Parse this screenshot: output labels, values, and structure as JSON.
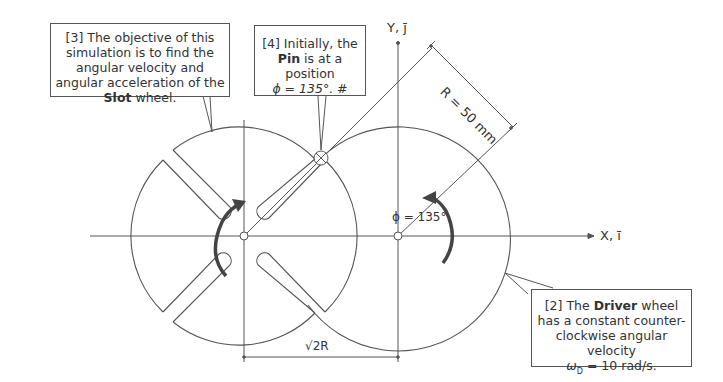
{
  "figure": {
    "type": "Geneva mechanism (slot wheel and driver wheel) schematic",
    "axes": {
      "x_label": "X, ī",
      "y_label": "Y, j̄"
    },
    "dimensions": {
      "radius_label": "R = 50 mm",
      "center_distance_label": "√2R",
      "angle_label": "ϕ = 135°"
    },
    "wheels": [
      {
        "name": "Slot wheel",
        "slots": 4,
        "rotation_arrow": "clockwise-arrow"
      },
      {
        "name": "Driver wheel",
        "rotation_arrow": "counterclockwise-arrow"
      }
    ]
  },
  "callouts": {
    "c3": {
      "prefix": "[3] The objective of this simulation is to find the angular velocity and angular acceleration of the ",
      "bold": "Slot",
      "suffix": " wheel."
    },
    "c4": {
      "prefix": "[4] Initially, the ",
      "bold": "Pin",
      "suffix": " is at a position",
      "line3": "ϕ = 135°. #"
    },
    "c2": {
      "prefix": "[2] The ",
      "bold": "Driver",
      "suffix": " wheel has a constant counter-clockwise angular velocity",
      "line4": "ω",
      "line4_sub": "D",
      "line4_rest": " = 10 rad/s."
    }
  },
  "colors": {
    "line": "#555555",
    "arrow": "#444444",
    "text": "#333333"
  }
}
